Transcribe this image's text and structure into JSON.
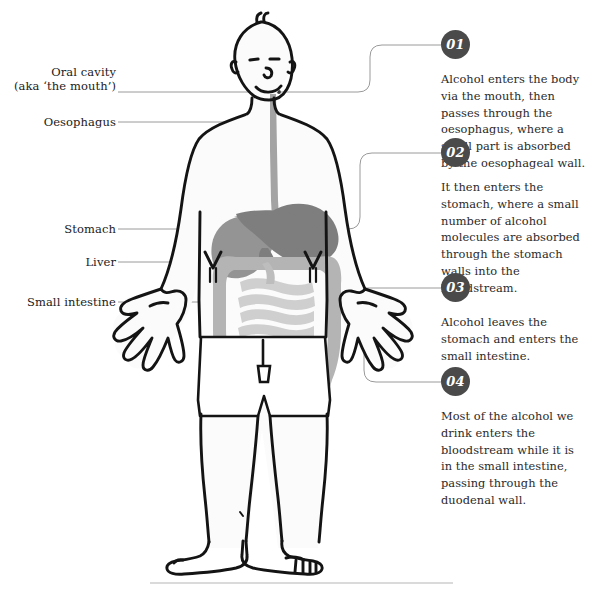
{
  "diagram": {
    "colors": {
      "outline": "#141414",
      "badge": "#4a4a4a",
      "leader_line": "#9a9a9a",
      "body_fill": "#fbfbfb",
      "oesophagus": "#a3a3a3",
      "stomach": "#7e7e7e",
      "liver": "#949494",
      "large_intestine": "#b4b4b4",
      "small_intestine": "#cfcfcf",
      "divider": "#b5b5b5",
      "text": "#1a1a1a"
    }
  },
  "left_labels": [
    {
      "id": "oral-cavity",
      "line1": "Oral cavity",
      "line2": "(aka ‘the mouth’)"
    },
    {
      "id": "oesophagus",
      "line1": "Oesophagus",
      "line2": ""
    },
    {
      "id": "stomach",
      "line1": "Stomach",
      "line2": ""
    },
    {
      "id": "liver",
      "line1": "Liver",
      "line2": ""
    },
    {
      "id": "small-intestine",
      "line1": "Small intestine",
      "line2": ""
    }
  ],
  "callouts": [
    {
      "number": "01",
      "text": "Alcohol enters the body via the mouth, then passes through the oesophagus, where a small part is absorbed by the oesophageal wall."
    },
    {
      "number": "02",
      "text": "It then enters the stomach, where a small number of alcohol molecules are absorbed through the stomach walls into the bloodstream."
    },
    {
      "number": "03",
      "text": "Alcohol leaves the stomach and enters the small intestine."
    },
    {
      "number": "04",
      "text": "Most of the alcohol we drink enters the bloodstream while it is in the small intestine, passing through the duodenal wall."
    }
  ]
}
